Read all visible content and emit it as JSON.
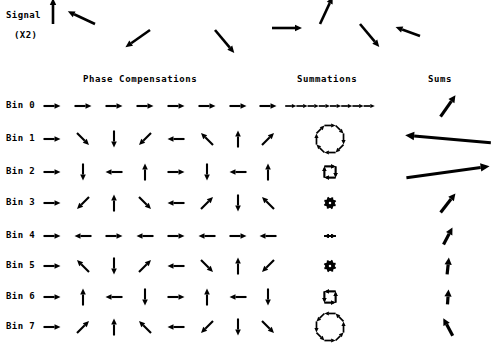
{
  "figure": {
    "signal_label_line1": "Signal",
    "signal_label_line2": "(X2)",
    "headers": {
      "phase": "Phase Compensations",
      "summations": "Summations",
      "sums": "Sums"
    }
  },
  "signal": {
    "name": "input-signal-vectors",
    "count": 8,
    "angles_deg": [
      90,
      155,
      215,
      310,
      0,
      65,
      310,
      160
    ],
    "lengths": [
      26,
      30,
      30,
      30,
      30,
      30,
      30,
      26
    ],
    "x_positions": [
      53,
      95,
      150,
      215,
      272,
      320,
      360,
      420
    ],
    "y_positions": [
      24,
      24,
      30,
      30,
      28,
      24,
      24,
      36
    ]
  },
  "bins": [
    {
      "label": "Bin 0",
      "rotation_step_deg": 0,
      "phase_angles_deg": [
        0,
        0,
        0,
        0,
        0,
        0,
        0,
        0
      ],
      "summation_shape": "closed-octagon-large",
      "sum_angle_deg": 55,
      "sum_length": 26
    },
    {
      "label": "Bin 1",
      "rotation_step_deg": -45,
      "phase_angles_deg": [
        0,
        -45,
        -90,
        -135,
        -180,
        -225,
        -270,
        -315
      ],
      "summation_shape": "open-arc-wide",
      "sum_angle_deg": 175,
      "sum_length": 86
    },
    {
      "label": "Bin 2",
      "rotation_step_deg": -90,
      "phase_angles_deg": [
        0,
        -90,
        -180,
        -270,
        0,
        -90,
        -180,
        -270
      ],
      "summation_shape": "open-arc-medium",
      "sum_angle_deg": 8,
      "sum_length": 84
    },
    {
      "label": "Bin 3",
      "rotation_step_deg": -135,
      "phase_angles_deg": [
        0,
        -135,
        -270,
        -45,
        -180,
        -315,
        -90,
        -225
      ],
      "summation_shape": "closed-octagon-large",
      "sum_angle_deg": 52,
      "sum_length": 24
    },
    {
      "label": "Bin 4",
      "rotation_step_deg": 180,
      "phase_angles_deg": [
        0,
        180,
        0,
        180,
        0,
        180,
        0,
        180
      ],
      "summation_shape": "closed-rosette-medium",
      "sum_angle_deg": 62,
      "sum_length": 19
    },
    {
      "label": "Bin 5",
      "rotation_step_deg": 135,
      "phase_angles_deg": [
        0,
        135,
        270,
        45,
        180,
        315,
        90,
        225
      ],
      "summation_shape": "closed-starburst",
      "sum_angle_deg": 84,
      "sum_length": 17
    },
    {
      "label": "Bin 6",
      "rotation_step_deg": 90,
      "phase_angles_deg": [
        0,
        90,
        180,
        270,
        0,
        90,
        180,
        270
      ],
      "summation_shape": "closed-starburst",
      "sum_angle_deg": 86,
      "sum_length": 15
    },
    {
      "label": "Bin 7",
      "rotation_step_deg": 45,
      "phase_angles_deg": [
        0,
        45,
        90,
        135,
        180,
        225,
        270,
        315
      ],
      "summation_shape": "closed-rosette-medium",
      "sum_angle_deg": 118,
      "sum_length": 20
    }
  ],
  "layout": {
    "row_y": [
      106,
      139,
      172,
      203,
      236,
      266,
      297,
      327
    ],
    "phase_col_x": [
      52,
      83,
      114,
      145,
      176,
      207,
      238,
      268
    ],
    "summation_center_x": 330,
    "sums_center_x": 448,
    "arrow_len": 17
  },
  "colors": {
    "ink": "#000000",
    "background": "#ffffff"
  }
}
